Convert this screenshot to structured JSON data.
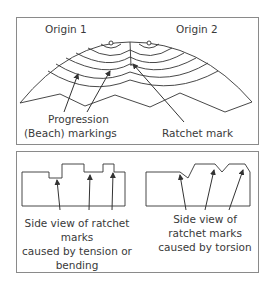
{
  "top_panel": {
    "origin1": "Origin 1",
    "origin2": "Origin 2",
    "progression_line1": "Progression",
    "progression_line2": "(Beach) markings",
    "ratchet": "Ratchet mark"
  },
  "bottom_panel": {
    "tension_lines": [
      "Side view of ratchet",
      "marks",
      "caused by tension or",
      "bending"
    ],
    "torsion_lines": [
      "Side view of",
      "ratchet marks",
      "caused by torsion"
    ]
  },
  "colors": {
    "line": "#333333",
    "frame": "#8a8a8a",
    "text": "#3a3a3a"
  }
}
